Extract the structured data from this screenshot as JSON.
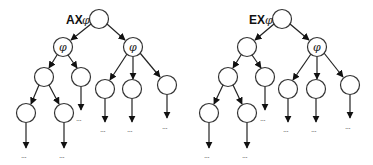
{
  "diagram": {
    "trees": [
      {
        "name": "ax-tree",
        "operator_label": "AX",
        "formula_symbol": "φ",
        "root": {
          "x": 99,
          "y": 19
        },
        "nodes": [
          {
            "id": "root",
            "x": 99,
            "y": 19,
            "label": ""
          },
          {
            "id": "l1a",
            "x": 63,
            "y": 47,
            "label": "φ"
          },
          {
            "id": "l1b",
            "x": 133,
            "y": 47,
            "label": "φ"
          },
          {
            "id": "l2a",
            "x": 44,
            "y": 77,
            "label": ""
          },
          {
            "id": "l2b",
            "x": 81,
            "y": 77,
            "label": ""
          },
          {
            "id": "l2c",
            "x": 105,
            "y": 89,
            "label": ""
          },
          {
            "id": "l2d",
            "x": 132,
            "y": 89,
            "label": ""
          },
          {
            "id": "l2e",
            "x": 167,
            "y": 85,
            "label": ""
          },
          {
            "id": "l3a",
            "x": 26,
            "y": 113,
            "label": ""
          },
          {
            "id": "l3b",
            "x": 64,
            "y": 113,
            "label": ""
          }
        ],
        "ellipses": [
          {
            "x": 26,
            "y": 156,
            "text": "..."
          },
          {
            "x": 64,
            "y": 156,
            "text": "..."
          },
          {
            "x": 81,
            "y": 119,
            "text": "..."
          },
          {
            "x": 105,
            "y": 130,
            "text": "..."
          },
          {
            "x": 132,
            "y": 130,
            "text": "..."
          },
          {
            "x": 167,
            "y": 127,
            "text": "..."
          }
        ]
      },
      {
        "name": "ex-tree",
        "operator_label": "EX",
        "formula_symbol": "φ",
        "root": {
          "x": 282,
          "y": 19
        },
        "nodes": [
          {
            "id": "root",
            "x": 282,
            "y": 19,
            "label": ""
          },
          {
            "id": "l1a",
            "x": 247,
            "y": 47,
            "label": ""
          },
          {
            "id": "l1b",
            "x": 317,
            "y": 47,
            "label": "φ"
          },
          {
            "id": "l2a",
            "x": 228,
            "y": 77,
            "label": ""
          },
          {
            "id": "l2b",
            "x": 265,
            "y": 77,
            "label": ""
          },
          {
            "id": "l2c",
            "x": 288,
            "y": 89,
            "label": ""
          },
          {
            "id": "l2d",
            "x": 316,
            "y": 89,
            "label": ""
          },
          {
            "id": "l2e",
            "x": 350,
            "y": 85,
            "label": ""
          },
          {
            "id": "l3a",
            "x": 209,
            "y": 113,
            "label": ""
          },
          {
            "id": "l3b",
            "x": 247,
            "y": 113,
            "label": ""
          }
        ],
        "ellipses": [
          {
            "x": 209,
            "y": 156,
            "text": "..."
          },
          {
            "x": 247,
            "y": 156,
            "text": "..."
          },
          {
            "x": 265,
            "y": 119,
            "text": "..."
          },
          {
            "x": 288,
            "y": 130,
            "text": "..."
          },
          {
            "x": 316,
            "y": 130,
            "text": "..."
          },
          {
            "x": 350,
            "y": 127,
            "text": "..."
          }
        ]
      }
    ],
    "labels": {
      "ax_operator": "AX",
      "ex_operator": "EX",
      "phi": "φ",
      "ellipsis": "..."
    }
  }
}
